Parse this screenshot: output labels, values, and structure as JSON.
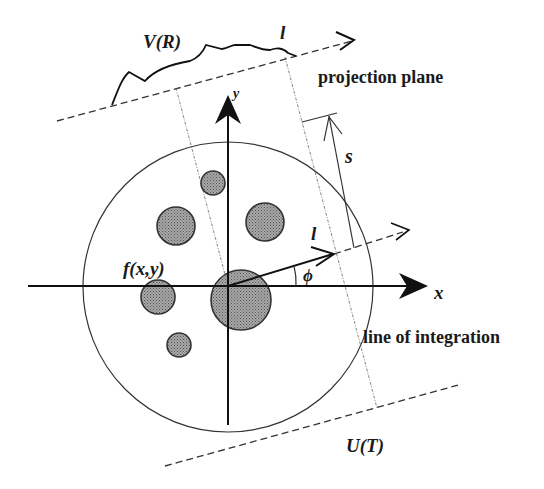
{
  "figure": {
    "type": "tomography-projection-geometry",
    "labels": {
      "projection_profile": "V(R)",
      "projection_axis_top": "l",
      "projection_plane": "projection plane",
      "y_axis": "y",
      "x_axis": "x",
      "distance": "s",
      "rotated_axis": "l",
      "angle": "ϕ",
      "object_function": "f(x,y)",
      "line_of_integration": "line of integration",
      "bottom_profile": "U(T)"
    },
    "colors": {
      "line": "#111111",
      "blob_fill": "#9a9a9a",
      "background": "#ffffff"
    }
  }
}
